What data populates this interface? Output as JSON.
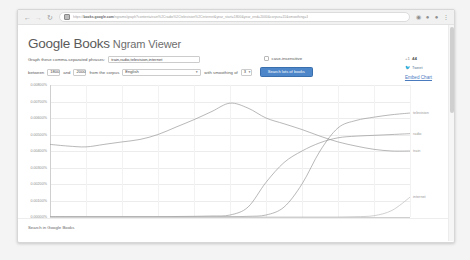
{
  "browser": {
    "back_icon": "back-arrow-icon",
    "forward_icon": "forward-arrow-icon",
    "reload_icon": "reload-icon",
    "lock_icon": "lock-icon",
    "url_prefix": "https://",
    "url_host": "books.google.com",
    "url_path": "/ngrams/graph?content=train%2Cradio%2Ctelevision%2Cinternet&year_start=1800&year_end=2000&corpus=15&smoothing=3",
    "extension_icon": "extension-icon",
    "profile_icon": "profile-icon",
    "account_icon": "account-icon",
    "menu_icon": "more-menu-icon"
  },
  "header": {
    "brand": "Google Books",
    "product": "Ngram Viewer"
  },
  "query": {
    "phrases_label": "Graph these comma-separated phrases:",
    "phrases_value": "train,radio,television,internet",
    "case_insensitive_label": "case-insensitive",
    "case_insensitive_checked": false,
    "between_label": "between",
    "year_start": "1800",
    "and_label": "and",
    "year_end": "2000",
    "corpus_label": "from the corpus",
    "corpus_value": "English",
    "smoothing_label": "with smoothing of",
    "smoothing_value": "3",
    "search_button": "Search lots of books",
    "caret_icon": "chevron-down-icon"
  },
  "social": {
    "gplus_label": "+1",
    "gplus_count": "44",
    "tweet_label": "Tweet",
    "tweet_icon": "twitter-bird-icon",
    "embed_label": "Embed Chart"
  },
  "footer": {
    "search_in_books": "Search in Google Books"
  },
  "chart_data": {
    "type": "line",
    "title": "",
    "xlabel": "(click on line/label for focus)",
    "ylabel": "",
    "xlim": [
      1800,
      2000
    ],
    "ylim": [
      0,
      0.008
    ],
    "grid": true,
    "legend_position": "right-inline",
    "xticks": [
      "1800",
      "1820",
      "1840",
      "1860",
      "1880",
      "1900",
      "1920",
      "1940",
      "1960",
      "1980",
      "2000"
    ],
    "yticks": [
      "0.00800%",
      "0.00700%",
      "0.00600%",
      "0.00500%",
      "0.00400%",
      "0.00300%",
      "0.00200%",
      "0.00100%",
      "0.00000%"
    ],
    "x": [
      1800,
      1810,
      1820,
      1830,
      1840,
      1850,
      1860,
      1870,
      1880,
      1890,
      1900,
      1910,
      1920,
      1930,
      1940,
      1950,
      1960,
      1970,
      1980,
      1990,
      2000
    ],
    "series": [
      {
        "name": "train",
        "color": "#9a9a9a",
        "label_x": 2000,
        "values": [
          0.0044,
          0.0043,
          0.00425,
          0.0044,
          0.00455,
          0.0047,
          0.005,
          0.00545,
          0.0059,
          0.0064,
          0.0069,
          0.0066,
          0.006,
          0.00565,
          0.0053,
          0.0049,
          0.00455,
          0.0043,
          0.0041,
          0.004,
          0.004
        ]
      },
      {
        "name": "radio",
        "color": "#9a9a9a",
        "label_x": 2000,
        "values": [
          2e-05,
          2e-05,
          2e-05,
          2e-05,
          2e-05,
          2e-05,
          2e-05,
          3e-05,
          4e-05,
          6e-05,
          0.00012,
          0.0006,
          0.0021,
          0.0033,
          0.004,
          0.0045,
          0.0048,
          0.0049,
          0.00495,
          0.005,
          0.00505
        ]
      },
      {
        "name": "television",
        "color": "#9a9a9a",
        "label_x": 2000,
        "values": [
          1e-05,
          1e-05,
          1e-05,
          1e-05,
          1e-05,
          1e-05,
          1e-05,
          1e-05,
          1e-05,
          1e-05,
          2e-05,
          4e-05,
          0.00012,
          0.0006,
          0.002,
          0.004,
          0.0054,
          0.00585,
          0.00605,
          0.0062,
          0.0063
        ]
      },
      {
        "name": "internet",
        "color": "#bdbdbd",
        "label_x": 2000,
        "values": [
          0,
          0,
          0,
          0,
          0,
          0,
          0,
          0,
          0,
          0,
          0,
          0,
          0,
          0,
          0,
          0,
          0,
          2e-05,
          8e-05,
          0.0004,
          0.0012
        ]
      }
    ]
  }
}
